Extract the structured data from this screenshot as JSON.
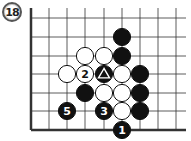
{
  "diagram": {
    "label": "18",
    "board": {
      "left_edge_x": 31,
      "bottom_edge_y": 130,
      "col_x": [
        31,
        49,
        67,
        85,
        104,
        122,
        140,
        158,
        176
      ],
      "row_y": [
        18,
        37,
        56,
        74,
        93,
        111,
        130
      ],
      "right_x": 186,
      "top_y": 8
    },
    "stones": [
      {
        "color": "black",
        "x": 122,
        "y": 37,
        "mark": ""
      },
      {
        "color": "white",
        "x": 85,
        "y": 56,
        "mark": ""
      },
      {
        "color": "white",
        "x": 104,
        "y": 56,
        "mark": ""
      },
      {
        "color": "black",
        "x": 122,
        "y": 56,
        "mark": ""
      },
      {
        "color": "white",
        "x": 67,
        "y": 74,
        "mark": ""
      },
      {
        "color": "white",
        "x": 85,
        "y": 74,
        "mark": "2"
      },
      {
        "color": "black",
        "x": 104,
        "y": 74,
        "mark": "triangle"
      },
      {
        "color": "white",
        "x": 122,
        "y": 74,
        "mark": ""
      },
      {
        "color": "black",
        "x": 140,
        "y": 74,
        "mark": ""
      },
      {
        "color": "black",
        "x": 85,
        "y": 93,
        "mark": ""
      },
      {
        "color": "white",
        "x": 104,
        "y": 93,
        "mark": ""
      },
      {
        "color": "white",
        "x": 122,
        "y": 93,
        "mark": ""
      },
      {
        "color": "black",
        "x": 140,
        "y": 93,
        "mark": ""
      },
      {
        "color": "black",
        "x": 67,
        "y": 111,
        "mark": "5"
      },
      {
        "color": "black",
        "x": 104,
        "y": 111,
        "mark": "3"
      },
      {
        "color": "white",
        "x": 122,
        "y": 111,
        "mark": ""
      },
      {
        "color": "black",
        "x": 140,
        "y": 111,
        "mark": ""
      },
      {
        "color": "black",
        "x": 122,
        "y": 130,
        "mark": "1"
      }
    ]
  }
}
